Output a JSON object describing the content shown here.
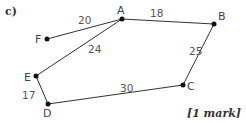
{
  "question_part": "c)",
  "marks": "[1 mark]",
  "graph": {
    "nodes": [
      {
        "id": "A",
        "x": 122,
        "y": 19,
        "lx": 117,
        "ly": 14
      },
      {
        "id": "B",
        "x": 214,
        "y": 24,
        "lx": 218,
        "ly": 20
      },
      {
        "id": "C",
        "x": 183,
        "y": 85,
        "lx": 187,
        "ly": 90
      },
      {
        "id": "D",
        "x": 48,
        "y": 104,
        "lx": 43,
        "ly": 117
      },
      {
        "id": "E",
        "x": 36,
        "y": 76,
        "lx": 24,
        "ly": 81
      },
      {
        "id": "F",
        "x": 47,
        "y": 39,
        "lx": 35,
        "ly": 43
      }
    ],
    "edges": [
      {
        "from": "F",
        "to": "A",
        "weight": "20",
        "lx": 78,
        "ly": 24
      },
      {
        "from": "A",
        "to": "B",
        "weight": "18",
        "lx": 150,
        "ly": 17
      },
      {
        "from": "A",
        "to": "E",
        "weight": "24",
        "lx": 88,
        "ly": 53
      },
      {
        "from": "B",
        "to": "C",
        "weight": "25",
        "lx": 189,
        "ly": 55
      },
      {
        "from": "C",
        "to": "D",
        "weight": "30",
        "lx": 120,
        "ly": 92
      },
      {
        "from": "E",
        "to": "D",
        "weight": "17",
        "lx": 22,
        "ly": 99
      }
    ]
  },
  "colors": {
    "line": "#333333",
    "node": "#111111"
  }
}
